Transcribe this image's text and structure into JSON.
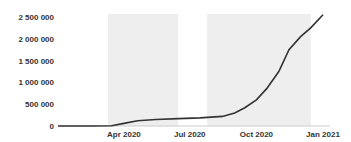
{
  "chart_data": {
    "type": "line",
    "title": "",
    "xlabel": "",
    "ylabel": "",
    "ylim": [
      0,
      2600000
    ],
    "y_ticks": [
      "0",
      "500 000",
      "1 000 000",
      "1 500 000",
      "2 000 000",
      "2 500 000"
    ],
    "x_ticks": [
      "Apr 2020",
      "Jul 2020",
      "Oct 2020",
      "Jan 2021"
    ],
    "grid": false,
    "shaded_periods": [
      {
        "start": "2020-03-10",
        "end": "2020-06-15"
      },
      {
        "start": "2020-07-25",
        "end": "2020-12-15"
      }
    ],
    "series": [
      {
        "name": "cumulative",
        "x": [
          "2020-01-01",
          "2020-02-15",
          "2020-03-15",
          "2020-04-01",
          "2020-04-20",
          "2020-05-15",
          "2020-06-15",
          "2020-07-15",
          "2020-08-15",
          "2020-09-01",
          "2020-09-15",
          "2020-10-01",
          "2020-10-15",
          "2020-11-01",
          "2020-11-15",
          "2020-12-01",
          "2020-12-15",
          "2021-01-01"
        ],
        "values": [
          0,
          0,
          5000,
          60000,
          120000,
          150000,
          170000,
          185000,
          220000,
          300000,
          420000,
          600000,
          850000,
          1250000,
          1750000,
          2050000,
          2250000,
          2550000
        ]
      }
    ],
    "line_color": "#333333",
    "shade_color": "#eeeeee"
  }
}
